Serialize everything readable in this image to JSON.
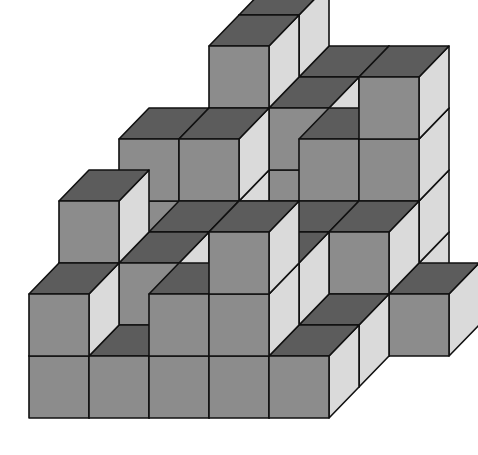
{
  "diagram": {
    "type": "isometric-cube-stack",
    "projection": {
      "origin_x": 29,
      "origin_y": 418,
      "cube_w": 60,
      "cube_h": 62,
      "depth_dx": 30,
      "depth_dy": -31
    },
    "colors": {
      "front": "#8c8c8c",
      "top": "#5c5c5c",
      "side": "#dadada",
      "edge": "#111111",
      "background": "#ffffff"
    },
    "voxels": [
      [
        0,
        0,
        0
      ],
      [
        1,
        0,
        0
      ],
      [
        2,
        0,
        0
      ],
      [
        3,
        0,
        0
      ],
      [
        4,
        0,
        0
      ],
      [
        0,
        0,
        1
      ],
      [
        2,
        0,
        1
      ],
      [
        3,
        0,
        1
      ],
      [
        3,
        0,
        2
      ],
      [
        0,
        1,
        0
      ],
      [
        0,
        1,
        1
      ],
      [
        0,
        1,
        2
      ],
      [
        1,
        1,
        0
      ],
      [
        1,
        1,
        1
      ],
      [
        3,
        1,
        0
      ],
      [
        3,
        1,
        1
      ],
      [
        4,
        1,
        0
      ],
      [
        1,
        2,
        0
      ],
      [
        1,
        2,
        1
      ],
      [
        2,
        2,
        0
      ],
      [
        2,
        2,
        1
      ],
      [
        3,
        2,
        0
      ],
      [
        3,
        2,
        1
      ],
      [
        4,
        2,
        0
      ],
      [
        4,
        2,
        1
      ],
      [
        5,
        2,
        0
      ],
      [
        0,
        3,
        0
      ],
      [
        0,
        3,
        1
      ],
      [
        0,
        3,
        2
      ],
      [
        1,
        3,
        0
      ],
      [
        1,
        3,
        1
      ],
      [
        1,
        3,
        2
      ],
      [
        3,
        3,
        0
      ],
      [
        3,
        3,
        1
      ],
      [
        3,
        3,
        2
      ],
      [
        4,
        3,
        0
      ],
      [
        4,
        3,
        1
      ],
      [
        4,
        3,
        2
      ],
      [
        4,
        3,
        3
      ],
      [
        1,
        4,
        0
      ],
      [
        1,
        4,
        1
      ],
      [
        1,
        4,
        2
      ],
      [
        1,
        4,
        3
      ],
      [
        2,
        4,
        0
      ],
      [
        2,
        4,
        1
      ],
      [
        2,
        4,
        2
      ],
      [
        1,
        5,
        0
      ],
      [
        1,
        5,
        1
      ],
      [
        1,
        5,
        2
      ],
      [
        1,
        5,
        3
      ],
      [
        2,
        5,
        0
      ],
      [
        2,
        5,
        1
      ],
      [
        2,
        5,
        2
      ]
    ]
  }
}
